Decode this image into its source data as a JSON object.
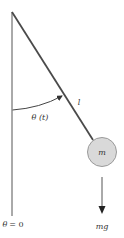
{
  "diagram": {
    "type": "simple-pendulum",
    "labels": {
      "angle": "θ (t)",
      "length": "l",
      "mass": "m",
      "force": "mg",
      "reference_theta": "θ",
      "reference_eq": "= 0"
    },
    "colors": {
      "line": "#555555",
      "rod": "#4a4a4a",
      "mass_fill": "#d9d9d9",
      "mass_stroke": "#9a9a9a",
      "text": "#333333"
    },
    "geometry": {
      "pivot": [
        12,
        12
      ],
      "vertical_end": [
        12,
        216
      ],
      "rod_end": [
        93,
        140
      ],
      "mass_center": [
        102,
        152
      ],
      "mass_radius": 14.5,
      "force_arrow": {
        "from": [
          102,
          177
        ],
        "to": [
          102,
          214
        ]
      }
    }
  }
}
